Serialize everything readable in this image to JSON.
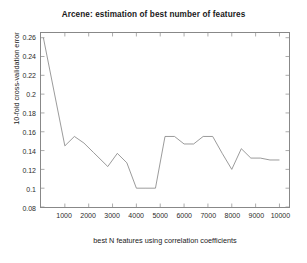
{
  "chart_data": {
    "type": "line",
    "title": "Arcene: estimation of best number of features",
    "xlabel": "best N features using correlation coefficients",
    "ylabel": "10-fold cross-validation error",
    "xlim": [
      0,
      10400
    ],
    "ylim": [
      0.08,
      0.265
    ],
    "xticks": [
      1000,
      2000,
      3000,
      4000,
      5000,
      6000,
      7000,
      8000,
      9000,
      10000
    ],
    "xtick_labels": [
      "1000",
      "2000",
      "3000",
      "4000",
      "5000",
      "6000",
      "7000",
      "8000",
      "9000",
      "10000"
    ],
    "yticks": [
      0.08,
      0.1,
      0.12,
      0.14,
      0.16,
      0.18,
      0.2,
      0.22,
      0.24,
      0.26
    ],
    "ytick_labels": [
      "0.08",
      "0.1",
      "0.12",
      "0.14",
      "0.16",
      "0.18",
      "0.2",
      "0.22",
      "0.24",
      "0.26"
    ],
    "grid": false,
    "legend": null,
    "line_color": "#808080",
    "line_width": 0.8,
    "series": [
      {
        "name": "10-fold cross-validation error",
        "x": [
          100,
          1000,
          1400,
          1800,
          2200,
          2600,
          2800,
          3200,
          3600,
          4000,
          4400,
          4800,
          5200,
          5600,
          6000,
          6400,
          6800,
          7200,
          7600,
          8000,
          8400,
          8800,
          9200,
          9600,
          10000
        ],
        "values": [
          0.26,
          0.145,
          0.155,
          0.148,
          0.138,
          0.128,
          0.123,
          0.137,
          0.127,
          0.1,
          0.1,
          0.1,
          0.155,
          0.155,
          0.147,
          0.147,
          0.155,
          0.155,
          0.137,
          0.12,
          0.142,
          0.132,
          0.132,
          0.13,
          0.13
        ]
      }
    ]
  }
}
